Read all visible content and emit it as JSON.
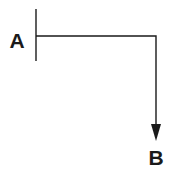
{
  "diagram": {
    "type": "flow-path",
    "nodes": [
      {
        "id": "A",
        "label": "A"
      },
      {
        "id": "B",
        "label": "B"
      }
    ],
    "edges": [
      {
        "from": "A",
        "to": "B",
        "route": "right-then-down",
        "arrow": "end"
      }
    ],
    "colors": {
      "stroke": "#1a1a1a",
      "background": "#ffffff"
    }
  }
}
